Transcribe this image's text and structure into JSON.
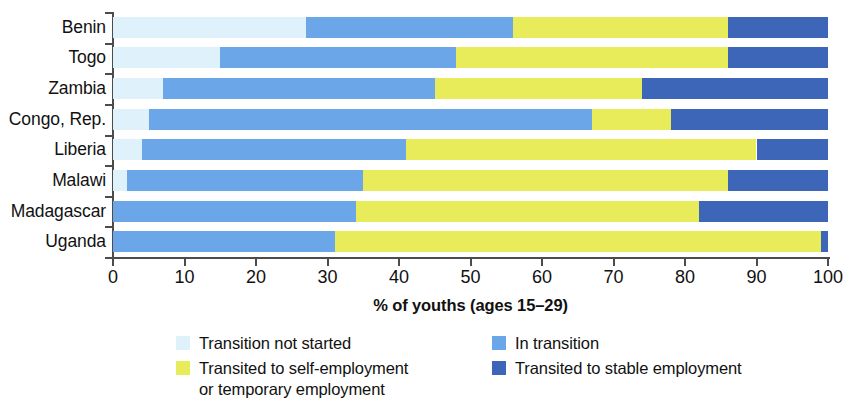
{
  "chart_data": {
    "type": "bar",
    "orientation": "horizontal",
    "stacked": true,
    "title": "",
    "xlabel": "% of youths (ages 15–29)",
    "ylabel": "",
    "xlim": [
      0,
      100
    ],
    "xticks": [
      0,
      10,
      20,
      30,
      40,
      50,
      60,
      70,
      80,
      90,
      100
    ],
    "grid": false,
    "legend_position": "bottom",
    "categories": [
      "Benin",
      "Togo",
      "Zambia",
      "Congo, Rep.",
      "Liberia",
      "Malawi",
      "Madagascar",
      "Uganda"
    ],
    "series": [
      {
        "name": "Transition not started",
        "color": "#dff1fb",
        "values": [
          27,
          15,
          7,
          5,
          4,
          2,
          0,
          0
        ]
      },
      {
        "name": "In transition",
        "color": "#6ba6e8",
        "values": [
          29,
          33,
          38,
          62,
          37,
          33,
          34,
          31
        ]
      },
      {
        "name": "Transited to self-employment\nor temporary employment",
        "color": "#e8ec5a",
        "values": [
          30,
          38,
          29,
          11,
          49,
          51,
          48,
          68
        ]
      },
      {
        "name": "Transited to stable employment",
        "color": "#3d65b8",
        "values": [
          14,
          14,
          26,
          22,
          10,
          14,
          18,
          1
        ]
      }
    ]
  },
  "legend": {
    "items": [
      {
        "label": "Transition not started",
        "color": "#dff1fb"
      },
      {
        "label": "In transition",
        "color": "#6ba6e8"
      },
      {
        "label": "Transited to self-employment\nor temporary employment",
        "color": "#e8ec5a"
      },
      {
        "label": "Transited to stable employment",
        "color": "#3d65b8"
      }
    ]
  },
  "axis": {
    "x_title": "% of youths (ages 15–29)",
    "tick_labels": [
      "0",
      "10",
      "20",
      "30",
      "40",
      "50",
      "60",
      "70",
      "80",
      "90",
      "100"
    ]
  }
}
